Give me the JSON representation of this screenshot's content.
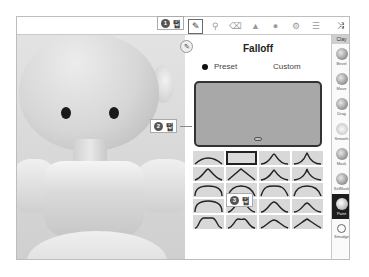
{
  "toolbar": {
    "icons": [
      {
        "name": "pen-icon",
        "glyph": "✎",
        "active": true
      },
      {
        "name": "brush-icon",
        "glyph": "⚲",
        "active": false
      },
      {
        "name": "eraser-icon",
        "glyph": "⌫",
        "active": false
      },
      {
        "name": "triangle-icon",
        "glyph": "▲",
        "active": false
      },
      {
        "name": "sphere-icon",
        "glyph": "●",
        "active": false
      },
      {
        "name": "settings-icon",
        "glyph": "⚙",
        "active": false
      },
      {
        "name": "menu-icon",
        "glyph": "☰",
        "active": false
      },
      {
        "name": "shuffle-icon",
        "glyph": "⤨",
        "active": false
      }
    ]
  },
  "float_button": {
    "glyph": "✎"
  },
  "panel": {
    "title": "Falloff",
    "radio": {
      "preset": "Preset",
      "custom": "Custom",
      "selected": "Preset"
    },
    "preset_count": 20,
    "selected_preset": 1
  },
  "sidebar": {
    "header": "Clay",
    "items": [
      {
        "label": "Bevel",
        "active": false
      },
      {
        "label": "Move",
        "active": false
      },
      {
        "label": "Drag",
        "active": false
      },
      {
        "label": "Smooth",
        "active": false
      },
      {
        "label": "Mask",
        "active": false
      },
      {
        "label": "SelMask",
        "active": false
      },
      {
        "label": "Paint",
        "active": true
      },
      {
        "label": "Smudge",
        "active": false
      }
    ]
  },
  "callouts": [
    {
      "number": "1",
      "text": "탭"
    },
    {
      "number": "2",
      "text": "탭"
    },
    {
      "number": "3",
      "text": "탭"
    }
  ]
}
